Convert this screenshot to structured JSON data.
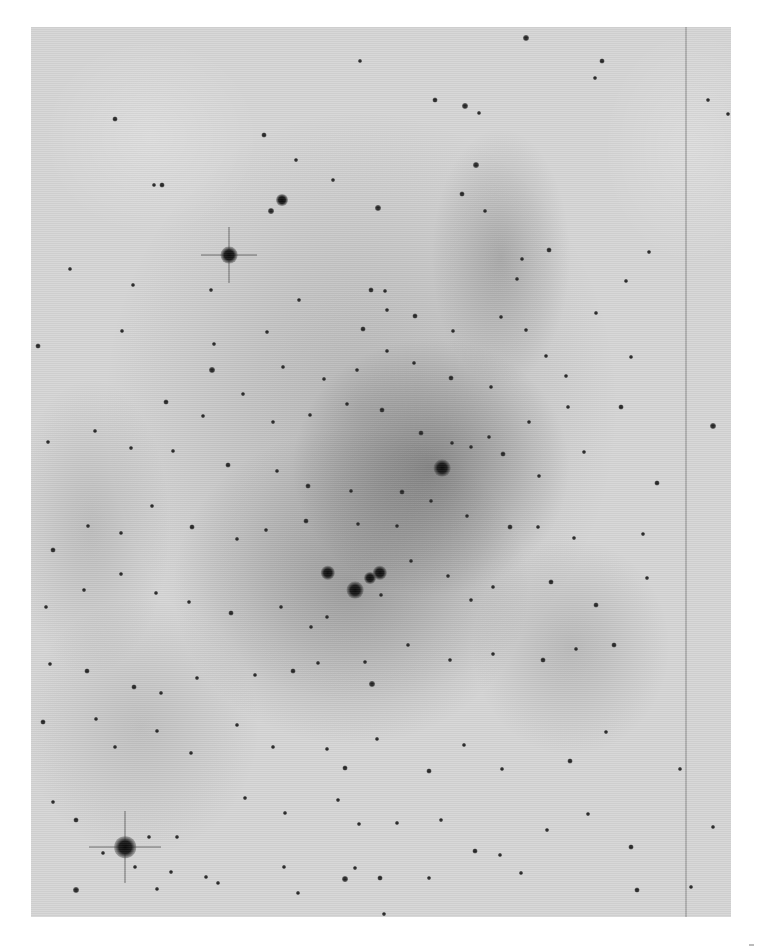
{
  "image": {
    "description": "Negative (inverted) grayscale astronomical photograph of a star cluster embedded in nebulosity",
    "background_color": "#ffffff",
    "plate": {
      "x": 31,
      "y": 27,
      "width": 700,
      "height": 890,
      "base_color": "#d6d6d6"
    },
    "edge_line_x": 654
  },
  "nebulosity": [
    {
      "x": 400,
      "y": 440,
      "w": 280,
      "h": 260,
      "opacity": 0.38
    },
    {
      "x": 320,
      "y": 560,
      "w": 360,
      "h": 320,
      "opacity": 0.28
    },
    {
      "x": 470,
      "y": 230,
      "w": 140,
      "h": 260,
      "opacity": 0.22
    },
    {
      "x": 330,
      "y": 380,
      "w": 520,
      "h": 600,
      "opacity": 0.18
    },
    {
      "x": 540,
      "y": 620,
      "w": 200,
      "h": 220,
      "opacity": 0.16
    },
    {
      "x": 110,
      "y": 700,
      "w": 240,
      "h": 260,
      "opacity": 0.12
    },
    {
      "x": 120,
      "y": 110,
      "w": 220,
      "h": 200,
      "opacity": -0.2
    },
    {
      "x": 660,
      "y": 120,
      "w": 180,
      "h": 240,
      "opacity": -0.18
    },
    {
      "x": 60,
      "y": 500,
      "w": 160,
      "h": 300,
      "opacity": 0.14
    }
  ],
  "bright_stars": [
    {
      "x": 94,
      "y": 820,
      "r": 9,
      "spikes": true
    },
    {
      "x": 198,
      "y": 228,
      "r": 7,
      "spikes": true
    },
    {
      "x": 411,
      "y": 441,
      "r": 7
    },
    {
      "x": 324,
      "y": 563,
      "r": 7
    },
    {
      "x": 297,
      "y": 546,
      "r": 6
    },
    {
      "x": 349,
      "y": 546,
      "r": 6
    },
    {
      "x": 339,
      "y": 551,
      "r": 5
    },
    {
      "x": 251,
      "y": 173,
      "r": 5
    }
  ],
  "stars": [
    [
      84,
      92,
      2.5
    ],
    [
      131,
      158,
      2.5
    ],
    [
      233,
      108,
      2.5
    ],
    [
      329,
      34,
      2
    ],
    [
      434,
      79,
      3
    ],
    [
      495,
      11,
      3
    ],
    [
      404,
      73,
      2.5
    ],
    [
      448,
      86,
      2
    ],
    [
      571,
      34,
      2.5
    ],
    [
      564,
      51,
      2
    ],
    [
      677,
      73,
      2
    ],
    [
      697,
      87,
      2
    ],
    [
      123,
      158,
      2
    ],
    [
      240,
      184,
      3
    ],
    [
      265,
      133,
      2
    ],
    [
      302,
      153,
      2
    ],
    [
      347,
      181,
      3
    ],
    [
      445,
      138,
      3
    ],
    [
      431,
      167,
      2.5
    ],
    [
      454,
      184,
      2
    ],
    [
      518,
      223,
      2.5
    ],
    [
      491,
      232,
      2
    ],
    [
      486,
      252,
      2
    ],
    [
      340,
      263,
      2.5
    ],
    [
      354,
      264,
      2
    ],
    [
      39,
      242,
      2
    ],
    [
      102,
      258,
      2
    ],
    [
      180,
      263,
      2
    ],
    [
      268,
      273,
      2
    ],
    [
      332,
      302,
      2.5
    ],
    [
      356,
      283,
      2
    ],
    [
      384,
      289,
      2.5
    ],
    [
      422,
      304,
      2
    ],
    [
      470,
      290,
      2
    ],
    [
      495,
      303,
      2
    ],
    [
      565,
      286,
      2
    ],
    [
      595,
      254,
      2
    ],
    [
      618,
      225,
      2
    ],
    [
      7,
      319,
      2.5
    ],
    [
      91,
      304,
      2
    ],
    [
      183,
      317,
      2
    ],
    [
      236,
      305,
      2
    ],
    [
      252,
      340,
      2
    ],
    [
      293,
      352,
      2
    ],
    [
      326,
      343,
      2
    ],
    [
      356,
      324,
      2
    ],
    [
      383,
      336,
      2
    ],
    [
      420,
      351,
      2.5
    ],
    [
      460,
      360,
      2
    ],
    [
      515,
      329,
      2
    ],
    [
      535,
      349,
      2
    ],
    [
      600,
      330,
      2
    ],
    [
      181,
      343,
      3
    ],
    [
      135,
      375,
      2.5
    ],
    [
      172,
      389,
      2
    ],
    [
      212,
      367,
      2
    ],
    [
      242,
      395,
      2
    ],
    [
      279,
      388,
      2
    ],
    [
      316,
      377,
      2
    ],
    [
      351,
      383,
      2.5
    ],
    [
      390,
      406,
      2.5
    ],
    [
      421,
      416,
      2
    ],
    [
      458,
      410,
      2
    ],
    [
      498,
      395,
      2
    ],
    [
      537,
      380,
      2
    ],
    [
      590,
      380,
      2.5
    ],
    [
      682,
      399,
      3
    ],
    [
      17,
      415,
      2
    ],
    [
      64,
      404,
      2
    ],
    [
      100,
      421,
      2
    ],
    [
      142,
      424,
      2
    ],
    [
      197,
      438,
      2.5
    ],
    [
      246,
      444,
      2
    ],
    [
      277,
      459,
      2.5
    ],
    [
      320,
      464,
      2
    ],
    [
      371,
      465,
      2.5
    ],
    [
      440,
      420,
      2
    ],
    [
      472,
      427,
      2.5
    ],
    [
      508,
      449,
      2
    ],
    [
      553,
      425,
      2
    ],
    [
      626,
      456,
      2.5
    ],
    [
      22,
      523,
      2.5
    ],
    [
      57,
      499,
      2
    ],
    [
      90,
      506,
      2
    ],
    [
      121,
      479,
      2
    ],
    [
      161,
      500,
      2.5
    ],
    [
      206,
      512,
      2
    ],
    [
      235,
      503,
      2
    ],
    [
      275,
      494,
      2.5
    ],
    [
      327,
      497,
      2
    ],
    [
      366,
      499,
      2
    ],
    [
      400,
      474,
      2
    ],
    [
      436,
      489,
      2
    ],
    [
      479,
      500,
      2.5
    ],
    [
      507,
      500,
      2
    ],
    [
      543,
      511,
      2
    ],
    [
      612,
      507,
      2
    ],
    [
      15,
      580,
      2
    ],
    [
      53,
      563,
      2
    ],
    [
      90,
      547,
      2
    ],
    [
      125,
      566,
      2
    ],
    [
      158,
      575,
      2
    ],
    [
      200,
      586,
      2.5
    ],
    [
      250,
      580,
      2
    ],
    [
      280,
      600,
      2
    ],
    [
      296,
      590,
      2
    ],
    [
      350,
      568,
      2
    ],
    [
      380,
      534,
      2
    ],
    [
      417,
      549,
      2
    ],
    [
      440,
      573,
      2
    ],
    [
      462,
      560,
      2
    ],
    [
      520,
      555,
      2.5
    ],
    [
      565,
      578,
      2.5
    ],
    [
      616,
      551,
      2
    ],
    [
      19,
      637,
      2
    ],
    [
      56,
      644,
      2.5
    ],
    [
      103,
      660,
      2.5
    ],
    [
      130,
      666,
      2
    ],
    [
      166,
      651,
      2
    ],
    [
      224,
      648,
      2
    ],
    [
      262,
      644,
      2.5
    ],
    [
      287,
      636,
      2
    ],
    [
      334,
      635,
      2
    ],
    [
      341,
      657,
      3
    ],
    [
      377,
      618,
      2
    ],
    [
      419,
      633,
      2
    ],
    [
      462,
      627,
      2
    ],
    [
      512,
      633,
      2.5
    ],
    [
      545,
      622,
      2
    ],
    [
      583,
      618,
      2.5
    ],
    [
      12,
      695,
      2.5
    ],
    [
      65,
      692,
      2
    ],
    [
      84,
      720,
      2
    ],
    [
      126,
      704,
      2
    ],
    [
      160,
      726,
      2
    ],
    [
      206,
      698,
      2
    ],
    [
      242,
      720,
      2
    ],
    [
      296,
      722,
      2
    ],
    [
      314,
      741,
      2.5
    ],
    [
      346,
      712,
      2
    ],
    [
      398,
      744,
      2.5
    ],
    [
      433,
      718,
      2
    ],
    [
      471,
      742,
      2
    ],
    [
      539,
      734,
      2.5
    ],
    [
      575,
      705,
      2
    ],
    [
      649,
      742,
      2
    ],
    [
      22,
      775,
      2
    ],
    [
      45,
      793,
      2.5
    ],
    [
      72,
      826,
      2
    ],
    [
      118,
      810,
      2
    ],
    [
      146,
      810,
      2
    ],
    [
      175,
      850,
      2
    ],
    [
      214,
      771,
      2
    ],
    [
      254,
      786,
      2
    ],
    [
      307,
      773,
      2
    ],
    [
      328,
      797,
      2
    ],
    [
      366,
      796,
      2
    ],
    [
      410,
      793,
      2
    ],
    [
      444,
      824,
      2.5
    ],
    [
      469,
      828,
      2
    ],
    [
      516,
      803,
      2
    ],
    [
      557,
      787,
      2
    ],
    [
      600,
      820,
      2.5
    ],
    [
      682,
      800,
      2
    ],
    [
      45,
      863,
      3
    ],
    [
      126,
      862,
      2
    ],
    [
      187,
      856,
      2
    ],
    [
      253,
      840,
      2
    ],
    [
      267,
      866,
      2
    ],
    [
      314,
      852,
      3
    ],
    [
      324,
      841,
      2
    ],
    [
      349,
      851,
      2.5
    ],
    [
      353,
      887,
      2
    ],
    [
      398,
      851,
      2
    ],
    [
      490,
      846,
      2
    ],
    [
      606,
      863,
      2.5
    ],
    [
      660,
      860,
      2
    ],
    [
      104,
      840,
      2
    ],
    [
      140,
      845,
      2
    ]
  ]
}
